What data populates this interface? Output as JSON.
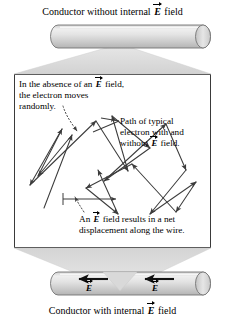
{
  "figure": {
    "width": 225,
    "height": 326,
    "background": "#ffffff",
    "ink": "#000000"
  },
  "captions": {
    "top": {
      "prefix": "Conductor without internal ",
      "vector_symbol": "E",
      "suffix": " field"
    },
    "bottom": {
      "prefix": "Conductor with internal ",
      "vector_symbol": "E",
      "suffix": " field"
    }
  },
  "conductors": {
    "top": {
      "name": "conductor-without-field",
      "fill_light": "#f2f2f2",
      "fill_mid": "#d8d8d8",
      "fill_dark": "#b9b9b9",
      "outline": "#6e6e6e",
      "has_field_arrows": false
    },
    "bottom": {
      "name": "conductor-with-field",
      "fill_light": "#f2f2f2",
      "fill_mid": "#d8d8d8",
      "fill_dark": "#b9b9b9",
      "outline": "#6e6e6e",
      "has_field_arrows": true,
      "field_arrows": [
        {
          "label": "E",
          "direction": "left",
          "x": 92,
          "y": 283
        },
        {
          "label": "E",
          "direction": "left",
          "x": 158,
          "y": 283
        }
      ]
    }
  },
  "funnels": {
    "top": {
      "fill": "#dcdcdc",
      "apex_x": 120,
      "apex_y": 44
    },
    "bottom": {
      "fill": "#dcdcdc",
      "apex_x": 120,
      "apex_y": 291
    }
  },
  "detail_box": {
    "border_color": "#3a3a3a",
    "background": "#ffffff",
    "annotations": {
      "absence": {
        "line1_a": "In the absence of an ",
        "line1_vector": "E",
        "line1_b": " field,",
        "line2": "the electron moves",
        "line3": "randomly."
      },
      "path": {
        "line1": "Path of typical",
        "line2": "electron with and",
        "line3_a": "without ",
        "line3_vector": "E",
        "line3_b": " field."
      },
      "net_displacement": {
        "line1_a": "An ",
        "line1_vector": "E",
        "line1_b": " field results in a net",
        "line2": "displacement along the wire."
      }
    },
    "electron_path": {
      "stroke": "#3c3c3c",
      "stroke_width": 1,
      "vertices": [
        [
          44,
          208
        ],
        [
          72,
          135
        ],
        [
          38,
          176
        ],
        [
          62,
          129
        ],
        [
          30,
          185
        ],
        [
          96,
          121
        ],
        [
          128,
          171
        ],
        [
          112,
          116
        ],
        [
          150,
          148
        ],
        [
          104,
          181
        ],
        [
          166,
          124
        ],
        [
          186,
          170
        ],
        [
          150,
          214
        ],
        [
          196,
          182
        ],
        [
          176,
          210
        ],
        [
          132,
          164
        ],
        [
          86,
          188
        ],
        [
          118,
          214
        ],
        [
          98,
          170
        ]
      ],
      "net_displacement_arrow": {
        "from": [
          63,
          199
        ],
        "to": [
          117,
          199
        ],
        "tick_at_start": true
      },
      "leader_absence": {
        "from": [
          62,
          105
        ],
        "to": [
          78,
          132
        ],
        "style": "dotted"
      },
      "leader_net": {
        "from": [
          82,
          213
        ],
        "to": [
          74,
          196
        ],
        "style": "dotted"
      },
      "leader_path": {
        "from": [
          118,
          120
        ],
        "to": [
          92,
          133
        ],
        "style": "solid"
      }
    }
  }
}
